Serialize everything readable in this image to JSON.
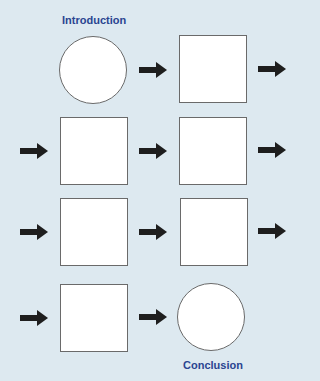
{
  "labels": {
    "start": "Introduction",
    "end": "Conclusion"
  },
  "colors": {
    "background": "#dde9f0",
    "label": "#2a4590",
    "arrow": "#1e1e1e",
    "node_fill": "#ffffff",
    "node_border": "#6a6a6a"
  },
  "nodes": [
    {
      "id": "intro",
      "shape": "circle",
      "x": 59,
      "y": 36,
      "size": 68
    },
    {
      "id": "step1",
      "shape": "square",
      "x": 179,
      "y": 35,
      "size": 68
    },
    {
      "id": "step2",
      "shape": "square",
      "x": 60,
      "y": 117,
      "size": 68
    },
    {
      "id": "step3",
      "shape": "square",
      "x": 179,
      "y": 117,
      "size": 68
    },
    {
      "id": "step4",
      "shape": "square",
      "x": 60,
      "y": 198,
      "size": 68
    },
    {
      "id": "step5",
      "shape": "square",
      "x": 180,
      "y": 198,
      "size": 68
    },
    {
      "id": "step6",
      "shape": "square",
      "x": 60,
      "y": 284,
      "size": 68
    },
    {
      "id": "conclusion",
      "shape": "circle",
      "x": 177,
      "y": 283,
      "size": 68
    }
  ],
  "arrows": [
    {
      "x": 139,
      "y": 62
    },
    {
      "x": 258,
      "y": 61
    },
    {
      "x": 20,
      "y": 143
    },
    {
      "x": 139,
      "y": 143
    },
    {
      "x": 258,
      "y": 142
    },
    {
      "x": 20,
      "y": 224
    },
    {
      "x": 139,
      "y": 224
    },
    {
      "x": 258,
      "y": 223
    },
    {
      "x": 20,
      "y": 310
    },
    {
      "x": 139,
      "y": 309
    }
  ]
}
